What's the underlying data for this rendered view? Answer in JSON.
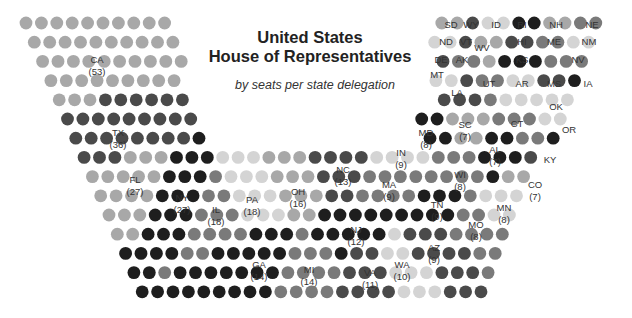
{
  "chart_data": {
    "type": "parliament-dot",
    "title": "United States House of Representatives",
    "title_lines": [
      "United States",
      "House of Representatives"
    ],
    "subtitle": "by seats per state delegation",
    "total_seats": 435,
    "shades": {
      "a": "#1e1e1e",
      "b": "#4a4a4a",
      "c": "#7a7a7a",
      "d": "#a8a8a8",
      "e": "#d4d4d4"
    },
    "states": [
      {
        "state": "CA",
        "seats": 53,
        "label": "CA",
        "show_count": true,
        "x": 97,
        "y": 60,
        "shade": "d"
      },
      {
        "state": "TX",
        "seats": 36,
        "label": "TX",
        "show_count": true,
        "x": 118,
        "y": 133,
        "shade": "b"
      },
      {
        "state": "FL",
        "seats": 27,
        "label": "FL",
        "show_count": true,
        "x": 135,
        "y": 180,
        "shade": "d"
      },
      {
        "state": "NY",
        "seats": 27,
        "label": "NY",
        "show_count": true,
        "x": 182,
        "y": 198,
        "shade": "a"
      },
      {
        "state": "IL",
        "seats": 18,
        "label": "IL",
        "show_count": true,
        "x": 216,
        "y": 210,
        "shade": "c"
      },
      {
        "state": "PA",
        "seats": 18,
        "label": "PA",
        "show_count": true,
        "x": 252,
        "y": 200,
        "shade": "e"
      },
      {
        "state": "OH",
        "seats": 16,
        "label": "OH",
        "show_count": true,
        "x": 298,
        "y": 192,
        "shade": "d"
      },
      {
        "state": "GA",
        "seats": 14,
        "label": "GA",
        "show_count": true,
        "x": 259,
        "y": 265,
        "shade": "a"
      },
      {
        "state": "MI",
        "seats": 14,
        "label": "MI",
        "show_count": true,
        "x": 309,
        "y": 270,
        "shade": "c"
      },
      {
        "state": "NC",
        "seats": 13,
        "label": "NC",
        "show_count": true,
        "x": 343,
        "y": 170,
        "shade": "b"
      },
      {
        "state": "NJ",
        "seats": 12,
        "label": "NJ",
        "show_count": true,
        "x": 356,
        "y": 230,
        "shade": "a"
      },
      {
        "state": "VA",
        "seats": 11,
        "label": "VA",
        "show_count": true,
        "x": 370,
        "y": 273,
        "shade": "b"
      },
      {
        "state": "WA",
        "seats": 10,
        "label": "WA",
        "show_count": true,
        "x": 402,
        "y": 265,
        "shade": "e"
      },
      {
        "state": "IN",
        "seats": 9,
        "label": "IN",
        "show_count": true,
        "x": 401,
        "y": 153,
        "shade": "e"
      },
      {
        "state": "MA",
        "seats": 9,
        "label": "MA",
        "show_count": true,
        "x": 389,
        "y": 185,
        "shade": "c"
      },
      {
        "state": "TN",
        "seats": 9,
        "label": "TN",
        "show_count": true,
        "x": 437,
        "y": 205,
        "shade": "a"
      },
      {
        "state": "AZ",
        "seats": 9,
        "label": "AZ",
        "show_count": true,
        "x": 434,
        "y": 248,
        "shade": "b"
      },
      {
        "state": "MD",
        "seats": 8,
        "label": "MD",
        "show_count": true,
        "x": 426,
        "y": 133,
        "shade": "a"
      },
      {
        "state": "WI",
        "seats": 8,
        "label": "WI",
        "show_count": true,
        "x": 460,
        "y": 175,
        "shade": "c"
      },
      {
        "state": "MO",
        "seats": 8,
        "label": "MO",
        "show_count": true,
        "x": 476,
        "y": 225,
        "shade": "c"
      },
      {
        "state": "MN",
        "seats": 8,
        "label": "MN",
        "show_count": true,
        "x": 504,
        "y": 208,
        "shade": "e"
      },
      {
        "state": "SC",
        "seats": 7,
        "label": "SC",
        "show_count": true,
        "x": 465,
        "y": 125,
        "shade": "d"
      },
      {
        "state": "AL",
        "seats": 7,
        "label": "AL",
        "show_count": true,
        "x": 495,
        "y": 150,
        "shade": "a"
      },
      {
        "state": "CO",
        "seats": 7,
        "label": "CO",
        "show_count": true,
        "x": 535,
        "y": 185,
        "shade": "d"
      },
      {
        "state": "KY",
        "seats": 6,
        "label": "KY",
        "show_count": false,
        "x": 550,
        "y": 160,
        "shade": "b"
      },
      {
        "state": "OR",
        "seats": 5,
        "label": "OR",
        "show_count": false,
        "x": 569,
        "y": 130,
        "shade": "a"
      },
      {
        "state": "CT",
        "seats": 5,
        "label": "CT",
        "show_count": false,
        "x": 517,
        "y": 124,
        "shade": "c"
      },
      {
        "state": "OK",
        "seats": 5,
        "label": "OK",
        "show_count": false,
        "x": 556,
        "y": 107,
        "shade": "e"
      },
      {
        "state": "LA",
        "seats": 6,
        "label": "LA",
        "show_count": false,
        "x": 457,
        "y": 93,
        "shade": "b"
      },
      {
        "state": "UT",
        "seats": 4,
        "label": "UT",
        "show_count": false,
        "x": 489,
        "y": 84,
        "shade": "c"
      },
      {
        "state": "AR",
        "seats": 4,
        "label": "AR",
        "show_count": false,
        "x": 522,
        "y": 84,
        "shade": "e"
      },
      {
        "state": "MS",
        "seats": 4,
        "label": "MS",
        "show_count": false,
        "x": 554,
        "y": 84,
        "shade": "b"
      },
      {
        "state": "IA",
        "seats": 4,
        "label": "IA",
        "show_count": false,
        "x": 588,
        "y": 84,
        "shade": "a"
      },
      {
        "state": "MT",
        "seats": 1,
        "label": "MT",
        "show_count": false,
        "x": 437,
        "y": 75,
        "shade": "e"
      },
      {
        "state": "NV",
        "seats": 4,
        "label": "NV",
        "show_count": false,
        "x": 578,
        "y": 60,
        "shade": "c"
      },
      {
        "state": "KS",
        "seats": 4,
        "label": "KS",
        "show_count": false,
        "x": 522,
        "y": 60,
        "shade": "a"
      },
      {
        "state": "AK",
        "seats": 1,
        "label": "AK",
        "show_count": false,
        "x": 462,
        "y": 60,
        "shade": "c"
      },
      {
        "state": "DE",
        "seats": 1,
        "label": "DE",
        "show_count": false,
        "x": 441,
        "y": 60,
        "shade": "b"
      },
      {
        "state": "WV",
        "seats": 3,
        "label": "WV",
        "show_count": false,
        "x": 482,
        "y": 48,
        "shade": "d"
      },
      {
        "state": "ND",
        "seats": 1,
        "label": "ND",
        "show_count": false,
        "x": 446,
        "y": 42,
        "shade": "e"
      },
      {
        "state": "VT",
        "seats": 1,
        "label": "VT",
        "show_count": false,
        "x": 466,
        "y": 42,
        "shade": "b"
      },
      {
        "state": "HI",
        "seats": 2,
        "label": "HI",
        "show_count": false,
        "x": 522,
        "y": 42,
        "shade": "b"
      },
      {
        "state": "ME",
        "seats": 2,
        "label": "ME",
        "show_count": false,
        "x": 554,
        "y": 42,
        "shade": "c"
      },
      {
        "state": "NM",
        "seats": 3,
        "label": "NM",
        "show_count": false,
        "x": 589,
        "y": 42,
        "shade": "e"
      },
      {
        "state": "SD",
        "seats": 1,
        "label": "SD",
        "show_count": false,
        "x": 451,
        "y": 25,
        "shade": "d"
      },
      {
        "state": "WY",
        "seats": 1,
        "label": "WY",
        "show_count": false,
        "x": 471,
        "y": 25,
        "shade": "b"
      },
      {
        "state": "ID",
        "seats": 2,
        "label": "ID",
        "show_count": false,
        "x": 496,
        "y": 25,
        "shade": "e"
      },
      {
        "state": "RI",
        "seats": 2,
        "label": "RI",
        "show_count": false,
        "x": 522,
        "y": 25,
        "shade": "a"
      },
      {
        "state": "NH",
        "seats": 2,
        "label": "NH",
        "show_count": false,
        "x": 556,
        "y": 25,
        "shade": "d"
      },
      {
        "state": "NE",
        "seats": 3,
        "label": "NE",
        "show_count": false,
        "x": 592,
        "y": 25,
        "shade": "c"
      }
    ]
  }
}
